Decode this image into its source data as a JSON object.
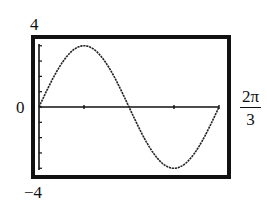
{
  "chart_data": {
    "type": "line",
    "title": "",
    "xlabel": "",
    "ylabel": "",
    "xlim": [
      "0",
      "2π/3"
    ],
    "ylim": [
      -4,
      4
    ],
    "x_tick_labels": [
      "0",
      "2π/3"
    ],
    "y_tick_labels": [
      "4",
      "0",
      "-4"
    ],
    "grid": false,
    "legend": null,
    "series": [
      {
        "name": "curve",
        "shape": "sinusoidal, one full cycle across window",
        "approx_amplitude": 3.5,
        "key_points": [
          {
            "x_frac": 0.0,
            "y": 0
          },
          {
            "x_frac": 0.25,
            "y": 3.5
          },
          {
            "x_frac": 0.5,
            "y": 0
          },
          {
            "x_frac": 0.75,
            "y": -3.5
          },
          {
            "x_frac": 1.0,
            "y": 0
          }
        ]
      }
    ]
  },
  "labels": {
    "ymax": "4",
    "ymin": "−4",
    "origin": "0",
    "xmax_num": "2π",
    "xmax_den": "3"
  }
}
